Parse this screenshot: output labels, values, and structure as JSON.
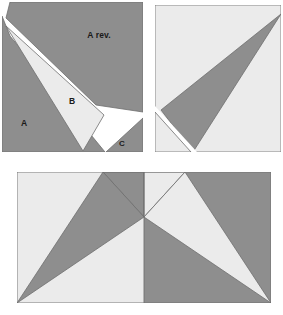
{
  "figure": {
    "type": "quilt-block-piecing-diagram",
    "colors": {
      "dark_fabric": "#8e8e8e",
      "light_fabric": "#ebebeb",
      "background": "#ffffff",
      "outline": "#6f6f6f",
      "label_text": "#1a1a1a"
    },
    "blocks": [
      {
        "id": "block-pieces",
        "name": "unit-pieces-top-left",
        "x": 2,
        "y": 2,
        "width": 141,
        "height": 150,
        "labels": [
          {
            "key": "a",
            "text": "A",
            "x": 24,
            "y": 126
          },
          {
            "key": "a_rev",
            "text": "A rev.",
            "x": 81,
            "y": 38
          },
          {
            "key": "b",
            "text": "B",
            "x": 72,
            "y": 104
          },
          {
            "key": "c",
            "text": "C",
            "x": 120,
            "y": 146
          }
        ]
      },
      {
        "id": "block-assembled",
        "name": "unit-assembled-top-right",
        "x": 155,
        "y": 5,
        "width": 126,
        "height": 147
      },
      {
        "id": "block-finished",
        "name": "finished-blocks-bottom",
        "x": 17,
        "y": 172,
        "width": 254,
        "height": 131,
        "panels": 2
      }
    ]
  }
}
